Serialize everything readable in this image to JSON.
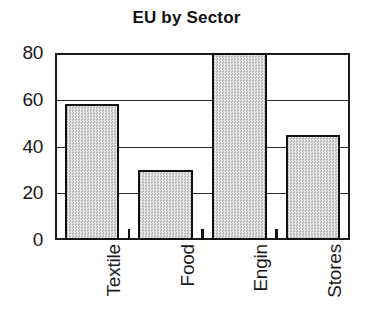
{
  "chart_data": {
    "type": "bar",
    "title": "EU by Sector",
    "xlabel": "",
    "ylabel": "",
    "categories": [
      "Textile",
      "Food",
      "Engin",
      "Stores"
    ],
    "values": [
      58,
      30,
      80,
      45
    ],
    "ylim": [
      0,
      80
    ],
    "yticks": [
      0,
      20,
      40,
      60,
      80
    ],
    "ytick_labels": [
      "0",
      "20",
      "40",
      "60",
      "80"
    ],
    "grid": "horizontal",
    "legend": "none",
    "bar_fill_color": "#d2d2d2",
    "bar_edge_color": "#111111",
    "axis_color": "#1b1b1b",
    "background_color": "#ffffff",
    "xtick_label_rotation": 90
  },
  "figure": {
    "title": "EU by Sector"
  }
}
